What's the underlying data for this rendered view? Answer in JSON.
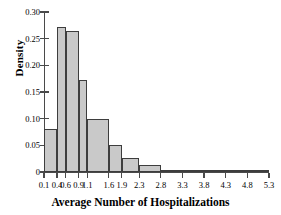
{
  "chart_data": {
    "type": "bar",
    "title": "",
    "xlabel": "Average Number of Hospitalizations",
    "ylabel": "Density",
    "grid": false,
    "legend": false,
    "ylim": [
      0,
      0.3
    ],
    "ytick_labels": [
      "0.30",
      "0.25",
      "0.20",
      "0.15",
      "0.10",
      "0.05",
      "0"
    ],
    "ytick_values": [
      0.3,
      0.25,
      0.2,
      0.15,
      0.1,
      0.05,
      0
    ],
    "xtick_labels": [
      "0.1",
      "0.4",
      "0.6",
      "0.9",
      "1.1",
      "1.6",
      "1.9",
      "2.3",
      "2.8",
      "3.3",
      "3.8",
      "4.3",
      "4.8",
      "5.3"
    ],
    "bin_edges": [
      0.1,
      0.4,
      0.6,
      0.9,
      1.1,
      1.6,
      1.9,
      2.3,
      2.8,
      3.3,
      3.8,
      4.3,
      4.8,
      5.3
    ],
    "categories": [
      "0.1-0.4",
      "0.4-0.6",
      "0.6-0.9",
      "0.9-1.1",
      "1.1-1.6",
      "1.6-1.9",
      "1.9-2.3",
      "2.3-2.8",
      "2.8-3.3",
      "3.3-3.8",
      "3.8-4.3",
      "4.3-4.8",
      "4.8-5.3"
    ],
    "values": [
      0.08,
      0.272,
      0.264,
      0.173,
      0.1,
      0.051,
      0.027,
      0.014,
      0.004,
      0.002,
      0.0,
      0.0,
      0.0
    ],
    "bar_color": "#c9c9c9",
    "bar_edge_color": "#3d3d3d",
    "axis_color": "#4a4a4a"
  }
}
